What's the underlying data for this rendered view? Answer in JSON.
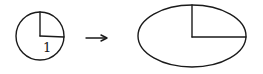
{
  "diagram": {
    "circle": {
      "radius_label": "1",
      "cx": 40,
      "cy": 36,
      "r": 24
    },
    "arrow": {
      "x1": 86,
      "y1": 38,
      "x2": 107,
      "y2": 38,
      "direction": "right"
    },
    "ellipse": {
      "cx": 192,
      "cy": 36,
      "rx": 54,
      "ry": 31
    },
    "stroke_color": "#1a1a1a",
    "background_color": "#ffffff"
  }
}
